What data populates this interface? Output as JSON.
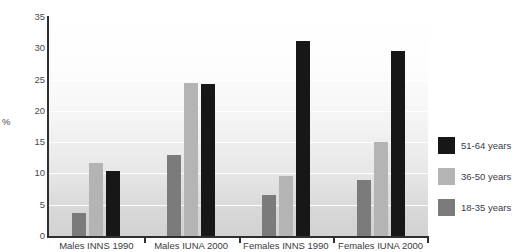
{
  "chart_data": {
    "type": "bar",
    "title": "",
    "xlabel": "",
    "ylabel": "%",
    "ylim": [
      0,
      35
    ],
    "yticks": [
      35,
      30,
      25,
      20,
      15,
      10,
      5,
      0
    ],
    "grid": true,
    "legend_position": "right",
    "categories": [
      "Males INNS 1990",
      "Males IUNA 2000",
      "Females INNS 1990",
      "Females IUNA 2000"
    ],
    "series": [
      {
        "name": "18-35 years",
        "color": "#7b7b7b",
        "values": [
          3.7,
          13.0,
          6.5,
          9.0
        ]
      },
      {
        "name": "36-50 years",
        "color": "#b4b4b4",
        "values": [
          11.6,
          24.5,
          9.6,
          15.0
        ]
      },
      {
        "name": "51-64 years",
        "color": "#171717",
        "values": [
          10.4,
          24.3,
          31.1,
          29.6
        ]
      }
    ],
    "legend_order": [
      "51-64 years",
      "36-50 years",
      "18-35 years"
    ]
  }
}
